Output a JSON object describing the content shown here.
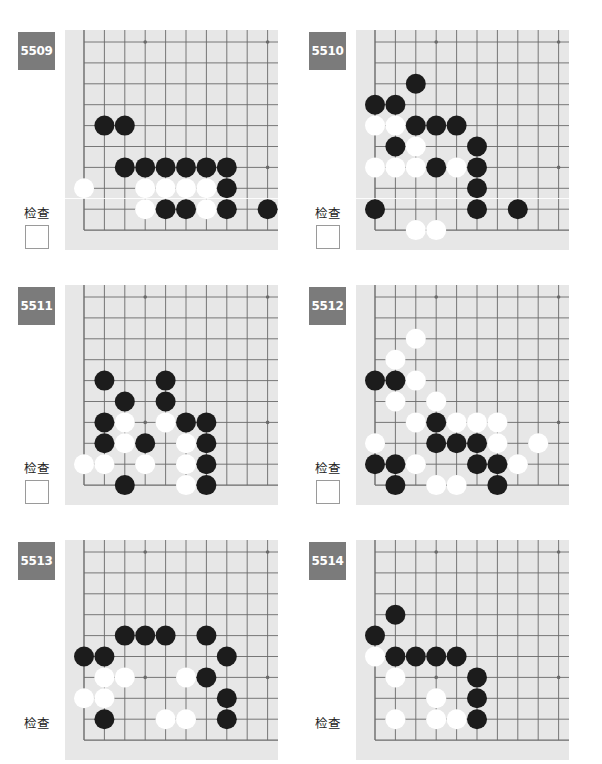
{
  "check_label": "检查",
  "colors": {
    "board_bg": "#e7e7e7",
    "grid_line": "#6a6a6a",
    "label_bg": "#7b7b7b",
    "black_stone": "#1c1c1c",
    "white_stone": "#ffffff"
  },
  "grid": {
    "cols": 10,
    "rows": 10,
    "hoshi": [
      [
        3,
        0
      ],
      [
        9,
        0
      ],
      [
        3,
        6
      ],
      [
        9,
        6
      ]
    ]
  },
  "problems": [
    {
      "number": "5509",
      "has_checkbox": true,
      "black": [
        [
          1,
          4
        ],
        [
          2,
          4
        ],
        [
          2,
          6
        ],
        [
          3,
          6
        ],
        [
          4,
          6
        ],
        [
          5,
          6
        ],
        [
          6,
          6
        ],
        [
          7,
          6
        ],
        [
          7,
          7
        ],
        [
          4,
          8
        ],
        [
          5,
          8
        ],
        [
          7,
          8
        ],
        [
          9,
          8
        ]
      ],
      "white": [
        [
          0,
          7
        ],
        [
          3,
          7
        ],
        [
          4,
          7
        ],
        [
          5,
          7
        ],
        [
          6,
          7
        ],
        [
          3,
          8
        ],
        [
          6,
          8
        ]
      ]
    },
    {
      "number": "5510",
      "has_checkbox": true,
      "black": [
        [
          2,
          2
        ],
        [
          0,
          3
        ],
        [
          1,
          3
        ],
        [
          2,
          4
        ],
        [
          3,
          4
        ],
        [
          4,
          4
        ],
        [
          1,
          5
        ],
        [
          5,
          5
        ],
        [
          3,
          6
        ],
        [
          5,
          6
        ],
        [
          5,
          7
        ],
        [
          0,
          8
        ],
        [
          5,
          8
        ],
        [
          7,
          8
        ]
      ],
      "white": [
        [
          0,
          4
        ],
        [
          1,
          4
        ],
        [
          2,
          5
        ],
        [
          0,
          6
        ],
        [
          1,
          6
        ],
        [
          2,
          6
        ],
        [
          4,
          6
        ],
        [
          2,
          9
        ],
        [
          3,
          9
        ]
      ]
    },
    {
      "number": "5511",
      "has_checkbox": true,
      "black": [
        [
          1,
          4
        ],
        [
          4,
          4
        ],
        [
          2,
          5
        ],
        [
          4,
          5
        ],
        [
          1,
          6
        ],
        [
          5,
          6
        ],
        [
          6,
          6
        ],
        [
          1,
          7
        ],
        [
          3,
          7
        ],
        [
          6,
          7
        ],
        [
          6,
          8
        ],
        [
          2,
          9
        ],
        [
          6,
          9
        ]
      ],
      "white": [
        [
          2,
          6
        ],
        [
          4,
          6
        ],
        [
          2,
          7
        ],
        [
          5,
          7
        ],
        [
          0,
          8
        ],
        [
          1,
          8
        ],
        [
          3,
          8
        ],
        [
          5,
          8
        ],
        [
          5,
          9
        ]
      ]
    },
    {
      "number": "5512",
      "has_checkbox": true,
      "black": [
        [
          0,
          4
        ],
        [
          1,
          4
        ],
        [
          3,
          6
        ],
        [
          3,
          7
        ],
        [
          4,
          7
        ],
        [
          5,
          7
        ],
        [
          0,
          8
        ],
        [
          1,
          8
        ],
        [
          5,
          8
        ],
        [
          6,
          8
        ],
        [
          1,
          9
        ],
        [
          6,
          9
        ]
      ],
      "white": [
        [
          2,
          2
        ],
        [
          1,
          3
        ],
        [
          2,
          4
        ],
        [
          1,
          5
        ],
        [
          3,
          5
        ],
        [
          2,
          6
        ],
        [
          4,
          6
        ],
        [
          5,
          6
        ],
        [
          6,
          6
        ],
        [
          0,
          7
        ],
        [
          6,
          7
        ],
        [
          8,
          7
        ],
        [
          2,
          8
        ],
        [
          7,
          8
        ],
        [
          3,
          9
        ],
        [
          4,
          9
        ]
      ]
    },
    {
      "number": "5513",
      "has_checkbox": false,
      "black": [
        [
          2,
          4
        ],
        [
          3,
          4
        ],
        [
          4,
          4
        ],
        [
          6,
          4
        ],
        [
          0,
          5
        ],
        [
          1,
          5
        ],
        [
          7,
          5
        ],
        [
          6,
          6
        ],
        [
          7,
          7
        ],
        [
          1,
          8
        ],
        [
          7,
          8
        ]
      ],
      "white": [
        [
          1,
          6
        ],
        [
          2,
          6
        ],
        [
          5,
          6
        ],
        [
          0,
          7
        ],
        [
          1,
          7
        ],
        [
          4,
          8
        ],
        [
          5,
          8
        ]
      ]
    },
    {
      "number": "5514",
      "has_checkbox": false,
      "black": [
        [
          1,
          3
        ],
        [
          0,
          4
        ],
        [
          1,
          5
        ],
        [
          2,
          5
        ],
        [
          3,
          5
        ],
        [
          4,
          5
        ],
        [
          5,
          6
        ],
        [
          5,
          7
        ],
        [
          5,
          8
        ]
      ],
      "white": [
        [
          0,
          5
        ],
        [
          1,
          6
        ],
        [
          3,
          7
        ],
        [
          1,
          8
        ],
        [
          3,
          8
        ],
        [
          4,
          8
        ]
      ]
    }
  ]
}
